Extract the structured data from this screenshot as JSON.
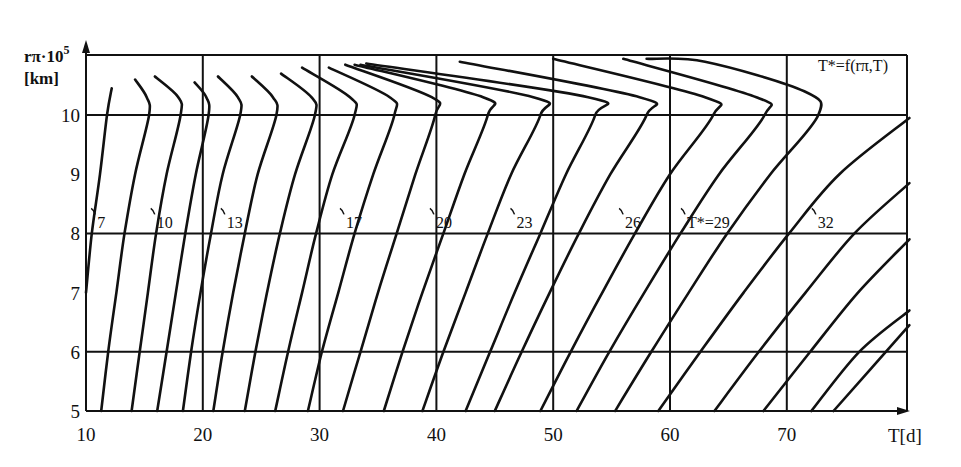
{
  "chart_data": {
    "type": "line",
    "title": "",
    "annotation": "T*=f(rπ,T)",
    "xlabel": "T[d]",
    "ylabel_line1": "rπ·10",
    "ylabel_sup": "5",
    "ylabel_line2": "[km]",
    "xlim": [
      10,
      80.5
    ],
    "ylim": [
      5,
      11
    ],
    "grid": true,
    "x_ticks": [
      10,
      20,
      30,
      40,
      50,
      60,
      70
    ],
    "y_ticks": [
      5,
      6,
      7,
      8,
      9,
      10
    ],
    "x_tick_labels": [
      "10",
      "20",
      "30",
      "40",
      "50",
      "60",
      "70"
    ],
    "y_tick_labels": [
      "5",
      "6",
      "7",
      "8",
      "9",
      "10"
    ],
    "curve_labels": [
      {
        "text": "7",
        "T": 11.3,
        "r": 8.05
      },
      {
        "text": "10",
        "T": 16.4,
        "r": 8.05
      },
      {
        "text": "13",
        "T": 22.4,
        "r": 8.05
      },
      {
        "text": "17",
        "T": 32.6,
        "r": 8.05
      },
      {
        "text": "20",
        "T": 40.3,
        "r": 8.05
      },
      {
        "text": "23",
        "T": 47.2,
        "r": 8.05
      },
      {
        "text": "26",
        "T": 56.5,
        "r": 8.05
      },
      {
        "text": "T*=29",
        "T": 61.8,
        "r": 8.05
      },
      {
        "text": "32",
        "T": 73.0,
        "r": 8.05
      }
    ],
    "series": [
      {
        "name": "c1",
        "points": [
          [
            10.0,
            7.0
          ],
          [
            10.5,
            8.0
          ],
          [
            11.2,
            9.0
          ],
          [
            11.8,
            10.0
          ],
          [
            12.2,
            10.45
          ]
        ]
      },
      {
        "name": "c2",
        "points": [
          [
            11.3,
            5.0
          ],
          [
            11.9,
            6.0
          ],
          [
            12.6,
            7.0
          ],
          [
            13.3,
            8.0
          ],
          [
            14.2,
            9.0
          ],
          [
            15.4,
            10.0
          ],
          [
            15.2,
            10.3
          ],
          [
            14.2,
            10.6
          ]
        ]
      },
      {
        "name": "c3",
        "points": [
          [
            13.9,
            5.0
          ],
          [
            14.6,
            6.0
          ],
          [
            15.3,
            7.0
          ],
          [
            16.0,
            8.0
          ],
          [
            16.9,
            9.0
          ],
          [
            18.1,
            10.0
          ],
          [
            17.9,
            10.3
          ],
          [
            15.9,
            10.65
          ]
        ]
      },
      {
        "name": "c4",
        "points": [
          [
            16.1,
            5.0
          ],
          [
            16.9,
            6.0
          ],
          [
            17.7,
            7.0
          ],
          [
            18.5,
            8.0
          ],
          [
            19.4,
            9.0
          ],
          [
            20.5,
            10.0
          ],
          [
            20.3,
            10.3
          ],
          [
            19.3,
            10.55
          ]
        ]
      },
      {
        "name": "c5",
        "points": [
          [
            18.3,
            5.0
          ],
          [
            19.0,
            6.0
          ],
          [
            19.8,
            7.0
          ],
          [
            20.7,
            8.0
          ],
          [
            21.7,
            9.0
          ],
          [
            23.2,
            10.0
          ],
          [
            23.0,
            10.3
          ],
          [
            21.3,
            10.65
          ]
        ]
      },
      {
        "name": "c6",
        "points": [
          [
            20.9,
            5.0
          ],
          [
            21.7,
            6.0
          ],
          [
            22.6,
            7.0
          ],
          [
            23.6,
            8.0
          ],
          [
            24.7,
            9.0
          ],
          [
            26.3,
            10.0
          ],
          [
            26.0,
            10.3
          ],
          [
            24.2,
            10.65
          ]
        ]
      },
      {
        "name": "c7",
        "points": [
          [
            23.6,
            5.0
          ],
          [
            24.5,
            6.0
          ],
          [
            25.5,
            7.0
          ],
          [
            26.6,
            8.0
          ],
          [
            27.9,
            9.0
          ],
          [
            29.6,
            10.0
          ],
          [
            29.3,
            10.3
          ],
          [
            26.7,
            10.7
          ]
        ]
      },
      {
        "name": "c8",
        "points": [
          [
            26.2,
            5.0
          ],
          [
            27.3,
            6.0
          ],
          [
            28.5,
            7.0
          ],
          [
            29.7,
            8.0
          ],
          [
            31.1,
            9.0
          ],
          [
            33.0,
            10.0
          ],
          [
            32.6,
            10.3
          ],
          [
            28.5,
            10.8
          ]
        ]
      },
      {
        "name": "c9",
        "points": [
          [
            29.0,
            5.0
          ],
          [
            30.2,
            6.0
          ],
          [
            31.6,
            7.0
          ],
          [
            33.0,
            8.0
          ],
          [
            34.6,
            9.0
          ],
          [
            36.4,
            10.0
          ],
          [
            36.0,
            10.3
          ],
          [
            30.8,
            10.8
          ]
        ]
      },
      {
        "name": "c10",
        "points": [
          [
            32.0,
            5.0
          ],
          [
            33.5,
            6.0
          ],
          [
            35.0,
            7.0
          ],
          [
            36.6,
            8.0
          ],
          [
            38.2,
            9.0
          ],
          [
            39.9,
            10.0
          ],
          [
            39.6,
            10.3
          ],
          [
            32.2,
            10.85
          ]
        ]
      },
      {
        "name": "c11",
        "points": [
          [
            35.5,
            5.0
          ],
          [
            37.1,
            6.0
          ],
          [
            38.8,
            7.0
          ],
          [
            40.6,
            8.0
          ],
          [
            42.4,
            9.0
          ],
          [
            44.4,
            10.0
          ],
          [
            44.0,
            10.3
          ],
          [
            33.0,
            10.85
          ]
        ]
      },
      {
        "name": "c12",
        "points": [
          [
            38.8,
            5.0
          ],
          [
            40.6,
            6.0
          ],
          [
            42.5,
            7.0
          ],
          [
            44.4,
            8.0
          ],
          [
            46.4,
            9.0
          ],
          [
            48.9,
            10.0
          ],
          [
            48.3,
            10.3
          ],
          [
            33.5,
            10.85
          ]
        ]
      },
      {
        "name": "c13",
        "points": [
          [
            42.5,
            5.0
          ],
          [
            44.6,
            6.0
          ],
          [
            46.7,
            7.0
          ],
          [
            48.9,
            8.0
          ],
          [
            51.1,
            9.0
          ],
          [
            53.6,
            10.0
          ],
          [
            53.0,
            10.3
          ],
          [
            34.0,
            10.87
          ]
        ]
      },
      {
        "name": "c14",
        "points": [
          [
            45.0,
            5.0
          ],
          [
            47.3,
            6.0
          ],
          [
            49.7,
            7.0
          ],
          [
            52.2,
            8.0
          ],
          [
            54.9,
            9.0
          ],
          [
            58.0,
            10.0
          ],
          [
            57.4,
            10.3
          ],
          [
            42.0,
            10.9
          ]
        ]
      },
      {
        "name": "c15",
        "points": [
          [
            48.9,
            5.0
          ],
          [
            51.5,
            6.0
          ],
          [
            54.2,
            7.0
          ],
          [
            57.0,
            8.0
          ],
          [
            60.0,
            9.0
          ],
          [
            63.7,
            10.0
          ],
          [
            63.0,
            10.3
          ],
          [
            50.0,
            10.95
          ]
        ]
      },
      {
        "name": "c16",
        "points": [
          [
            52.0,
            5.0
          ],
          [
            54.8,
            6.0
          ],
          [
            57.8,
            7.0
          ],
          [
            60.9,
            8.0
          ],
          [
            64.2,
            9.0
          ],
          [
            68.1,
            10.0
          ],
          [
            67.4,
            10.3
          ],
          [
            56.0,
            10.95
          ]
        ]
      },
      {
        "name": "c17",
        "points": [
          [
            55.3,
            5.0
          ],
          [
            58.4,
            6.0
          ],
          [
            61.6,
            7.0
          ],
          [
            64.9,
            8.0
          ],
          [
            68.6,
            9.0
          ],
          [
            72.7,
            10.0
          ],
          [
            71.5,
            10.4
          ],
          [
            63.0,
            10.9
          ],
          [
            58.0,
            10.95
          ]
        ]
      },
      {
        "name": "c18",
        "points": [
          [
            59.0,
            5.0
          ],
          [
            62.6,
            6.0
          ],
          [
            66.3,
            7.0
          ],
          [
            70.2,
            8.0
          ],
          [
            74.5,
            9.0
          ],
          [
            80.5,
            9.95
          ]
        ]
      },
      {
        "name": "c19",
        "points": [
          [
            63.8,
            5.0
          ],
          [
            67.6,
            6.0
          ],
          [
            71.6,
            7.0
          ],
          [
            75.8,
            8.0
          ],
          [
            80.5,
            8.85
          ]
        ]
      },
      {
        "name": "c20",
        "points": [
          [
            68.0,
            5.0
          ],
          [
            72.0,
            6.0
          ],
          [
            76.1,
            7.0
          ],
          [
            80.5,
            7.9
          ]
        ]
      },
      {
        "name": "c21",
        "points": [
          [
            72.1,
            5.0
          ],
          [
            76.2,
            6.0
          ],
          [
            80.5,
            6.7
          ]
        ]
      },
      {
        "name": "c22",
        "points": [
          [
            74.0,
            5.0
          ],
          [
            80.5,
            6.45
          ]
        ]
      }
    ]
  }
}
